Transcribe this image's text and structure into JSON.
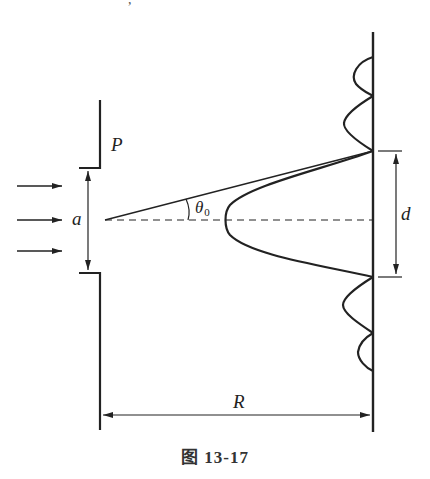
{
  "diagram": {
    "type": "single-slit Fraunhofer diffraction",
    "labels": {
      "plate": "P",
      "slit_width": "a",
      "angle": "θ",
      "angle_sub": "0",
      "central_width": "d",
      "distance": "R"
    },
    "caption": "图 13-17",
    "colors": {
      "line": "#222222",
      "background": "#ffffff"
    },
    "elements": [
      "three incident arrows (plane wave) from left",
      "opaque plate P with slit of width a",
      "dashed central axis",
      "ray at angle θ0 to first minimum",
      "screen at distance R",
      "intensity pattern: central maximum width d, two side lobes each side"
    ]
  }
}
